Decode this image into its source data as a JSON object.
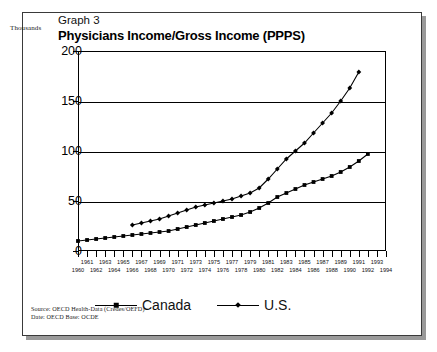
{
  "header": {
    "graph_number": "Graph 3",
    "title": "Physicians Income/Gross Income (PPPS)",
    "units_label": "Thousands"
  },
  "legend": {
    "items": [
      {
        "label": "Canada",
        "marker": "diamond-marker"
      },
      {
        "label": "U.S.",
        "marker": "diamond-marker"
      }
    ]
  },
  "notes": {
    "source": "Source: OECD Health-Data (Credes/OEFD)",
    "date": "Date: OECD Base: OCDE"
  },
  "chart_data": {
    "type": "line",
    "title": "Physicians Income/Gross Income (PPPS)",
    "subtitle": "Graph 3",
    "xlabel": "",
    "ylabel": "Thousands",
    "ylim": [
      0,
      200
    ],
    "yticks": [
      0,
      50,
      100,
      150,
      200
    ],
    "ytick_labels": [
      "0",
      "50",
      "100",
      "150",
      "200"
    ],
    "xlim": [
      1960,
      1994
    ],
    "grid": true,
    "legend_position": "bottom",
    "x": [
      1960,
      1961,
      1962,
      1963,
      1964,
      1965,
      1966,
      1967,
      1968,
      1969,
      1970,
      1971,
      1972,
      1973,
      1974,
      1975,
      1976,
      1977,
      1978,
      1979,
      1980,
      1981,
      1982,
      1983,
      1984,
      1985,
      1986,
      1987,
      1988,
      1989,
      1990,
      1991,
      1992,
      1993,
      1994
    ],
    "xtick_labels_top": [
      "1961",
      "1963",
      "1965",
      "1967",
      "1969",
      "1971",
      "1973",
      "1975",
      "1977",
      "1979",
      "1981",
      "1983",
      "1985",
      "1987",
      "1989",
      "1991",
      "1993"
    ],
    "xtick_labels_bottom": [
      "1960",
      "1962",
      "1964",
      "1966",
      "1968",
      "1970",
      "1972",
      "1974",
      "1976",
      "1978",
      "1980",
      "1982",
      "1984",
      "1986",
      "1988",
      "1990",
      "1992",
      "1994"
    ],
    "series": [
      {
        "name": "Canada",
        "x": [
          1960,
          1961,
          1962,
          1963,
          1964,
          1965,
          1966,
          1967,
          1968,
          1969,
          1970,
          1971,
          1972,
          1973,
          1974,
          1975,
          1976,
          1977,
          1978,
          1979,
          1980,
          1981,
          1982,
          1983,
          1984,
          1985,
          1986,
          1987,
          1988,
          1989,
          1990,
          1991,
          1992
        ],
        "values": [
          10,
          11,
          12,
          13,
          14,
          15,
          16,
          17,
          18,
          19,
          20,
          22,
          24,
          26,
          28,
          30,
          32,
          34,
          36,
          39,
          43,
          48,
          54,
          58,
          62,
          66,
          69,
          72,
          75,
          79,
          84,
          90,
          97
        ]
      },
      {
        "name": "U.S.",
        "x": [
          1966,
          1967,
          1968,
          1969,
          1970,
          1971,
          1972,
          1973,
          1974,
          1975,
          1976,
          1977,
          1978,
          1979,
          1980,
          1981,
          1982,
          1983,
          1984,
          1985,
          1986,
          1987,
          1988,
          1989,
          1990,
          1991
        ],
        "values": [
          26,
          28,
          30,
          32,
          35,
          38,
          41,
          44,
          46,
          48,
          50,
          52,
          55,
          58,
          63,
          72,
          82,
          92,
          100,
          108,
          118,
          128,
          138,
          150,
          163,
          179
        ]
      }
    ]
  }
}
